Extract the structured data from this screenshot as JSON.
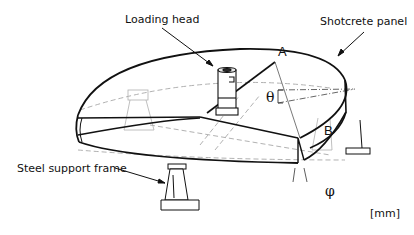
{
  "diagram": {
    "labels": {
      "loading_head": "Loading head",
      "shotcrete_panel": "Shotcrete panel",
      "steel_support_frame": "Steel support frame",
      "unit": "[mm]"
    },
    "points": {
      "a": "A",
      "b": "B"
    },
    "angles": {
      "theta": "θ",
      "phi": "φ"
    },
    "colors": {
      "stroke": "#111111",
      "hidden_line": "#9a9a9a",
      "background": "#ffffff"
    }
  }
}
